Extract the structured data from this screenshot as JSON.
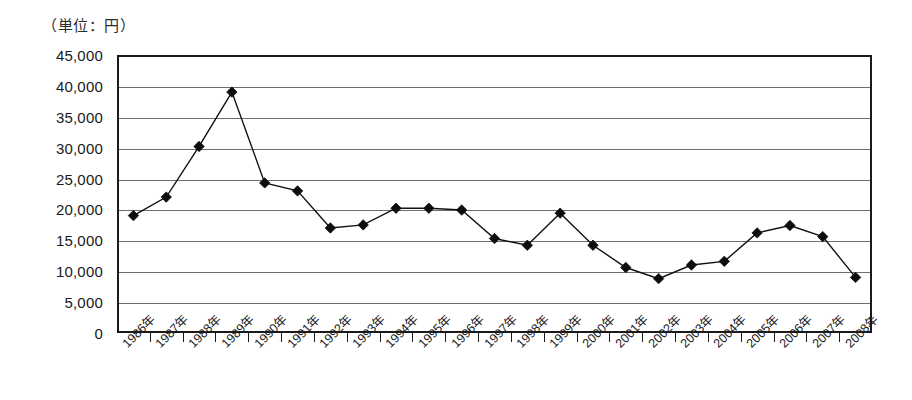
{
  "unit_label": "（単位：円）",
  "chart_data": {
    "type": "line",
    "title": "",
    "subtitle": "",
    "xlabel": "",
    "ylabel": "",
    "unit_note": "（単位：円）",
    "grid": "horizontal",
    "legend_position": "none",
    "marker": "diamond",
    "series_color": "#111111",
    "ylim": [
      0,
      45000
    ],
    "ytick_step": 5000,
    "ytick_labels": [
      "45,000",
      "40,000",
      "35,000",
      "30,000",
      "25,000",
      "20,000",
      "15,000",
      "10,000",
      "5,000",
      "0"
    ],
    "ytick_values": [
      45000,
      40000,
      35000,
      30000,
      25000,
      20000,
      15000,
      10000,
      5000,
      0
    ],
    "categories": [
      "1986年",
      "1987年",
      "1988年",
      "1989年",
      "1990年",
      "1991年",
      "1992年",
      "1993年",
      "1994年",
      "1995年",
      "1996年",
      "1997年",
      "1998年",
      "1999年",
      "2000年",
      "2001年",
      "2002年",
      "2003年",
      "2004年",
      "2005年",
      "2006年",
      "2007年",
      "2008年"
    ],
    "series": [
      {
        "name": "",
        "values": [
          19000,
          22000,
          30200,
          39000,
          24300,
          23000,
          17000,
          17500,
          20200,
          20200,
          19900,
          15300,
          14200,
          19400,
          14200,
          10600,
          8800,
          11000,
          11600,
          16200,
          17400,
          15600,
          9000
        ]
      }
    ]
  }
}
